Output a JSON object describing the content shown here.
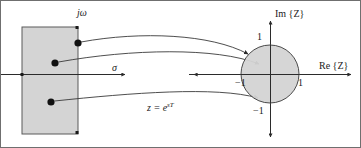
{
  "figure": {
    "background_color": "#ffffff",
    "region_fill_color": "#d4d4d4",
    "stroke_color": "#4a4a4a",
    "text_color": "#1a1a1a",
    "width": 361,
    "height": 148
  },
  "splane": {
    "axis_imaginary_label": "jω",
    "axis_real_label": "σ",
    "region_name": "left-half-plane",
    "poles": [
      {
        "name": "pole-upper",
        "x": 77,
        "y": 42
      },
      {
        "name": "pole-middle",
        "x": 54,
        "y": 62
      },
      {
        "name": "pole-lower",
        "x": 50,
        "y": 101
      }
    ]
  },
  "mapping": {
    "equation_lhs": "z = e",
    "equation_exponent": "sT"
  },
  "zplane": {
    "axis_imaginary_label": "Im {Z}",
    "axis_real_label": "Re {Z}",
    "tick_im_positive": "1",
    "tick_im_negative": "−1",
    "tick_re_positive": "1",
    "tick_re_negative": "−1",
    "unit_circle": {
      "center_x": 269,
      "center_y": 73,
      "radius": 29
    }
  },
  "arrows": [
    {
      "name": "map-arrow-upper",
      "from": "pole-upper",
      "to": "unit-circle-upper"
    },
    {
      "name": "map-arrow-middle",
      "from": "pole-middle",
      "to": "unit-circle-middle"
    },
    {
      "name": "map-arrow-lower",
      "from": "pole-lower",
      "to": "unit-circle-lower"
    },
    {
      "name": "map-arrow-axis",
      "from": "sigma-axis",
      "to": "negative-one"
    }
  ]
}
